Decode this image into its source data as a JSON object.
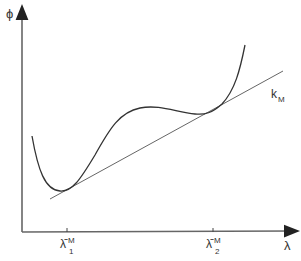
{
  "diagram": {
    "y_axis_label": "ϕ",
    "x_axis_label": "λ",
    "line_label": "k",
    "line_label_sub": "M",
    "ticks": [
      {
        "base": "λ̄",
        "sup": "M",
        "sub": "1"
      },
      {
        "base": "λ̄",
        "sup": "M",
        "sub": "2"
      }
    ],
    "colors": {
      "axis": "#555555",
      "curve": "#333333",
      "line": "#555555"
    }
  }
}
